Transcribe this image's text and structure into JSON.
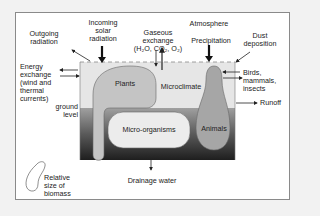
{
  "diagram": {
    "top_labels": {
      "outgoing_radiation": "Outgoing\nradiation",
      "incoming_solar_radiation": "Incoming\nsolar\nradiation",
      "gaseous_exchange": "Gaseous\nexchange\n(H₂O, CO₂, O₂)",
      "atmosphere": "Atmosphere",
      "precipitation": "Precipitation",
      "dust_deposition": "Dust\ndeposition"
    },
    "left_labels": {
      "energy_exchange": "Energy\nexchange\n(wind and\nthermal\ncurrents)",
      "ground_level": "ground\nlevel"
    },
    "right_labels": {
      "birds_mammals_insects": "Birds,\nmammals,\ninsects",
      "runoff": "Runoff"
    },
    "compartments": {
      "plants": "Plants",
      "microclimate": "Microclimate",
      "micro_organisms": "Micro-organisms",
      "animals": "Animals"
    },
    "bottom_labels": {
      "drainage_water": "Drainage water"
    },
    "legend": {
      "text": "Relative\nsize of\nbiomass"
    },
    "colors": {
      "atmosphere_zone": "#e8e8e8",
      "soil_top": "#9a9a9a",
      "soil_bottom": "#222222",
      "plants_fill": "#c8c8c8",
      "microorganisms_fill": "#ececec",
      "animals_fill": "#a8a8a8"
    }
  }
}
